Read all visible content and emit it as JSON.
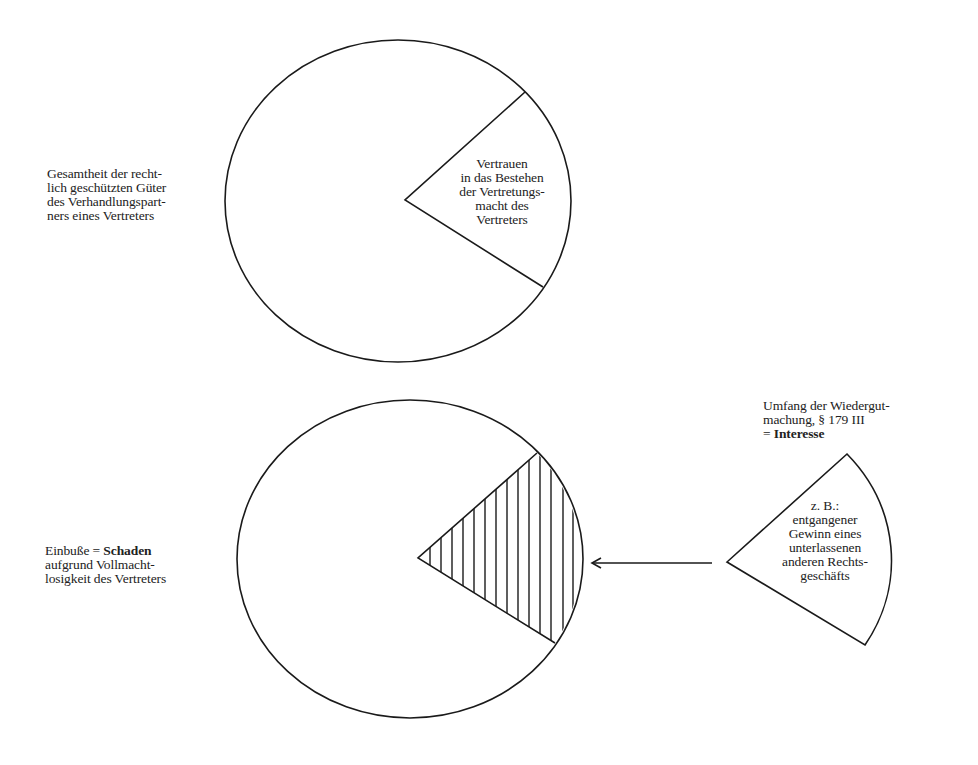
{
  "diagram": {
    "top_circle": {
      "label_left": [
        "Gesamtheit der recht-",
        "lich geschützten Güter",
        "des Verhandlungspart-",
        "ners eines Vertreters"
      ],
      "slice_label": [
        "Vertrauen",
        "in das Bestehen",
        "der Vertretungs-",
        "macht des",
        "Vertreters"
      ]
    },
    "bottom_circle": {
      "label_left": {
        "line1_prefix": "Einbuße = ",
        "line1_bold": "Schaden",
        "line2": "aufgrund Vollmacht-",
        "line3": "losigkeit des Vertreters"
      },
      "hatched_slice": "Schaden (hatched)"
    },
    "detached_sector": {
      "heading": {
        "line1": "Umfang der Wiedergut-",
        "line2": "machung, § 179 III",
        "line3_prefix": "= ",
        "line3_bold": "Interesse"
      },
      "label": [
        "z. B.:",
        "entgangener",
        "Gewinn eines",
        "unterlassenen",
        "anderen Rechts-",
        "geschäfts"
      ]
    },
    "arrow": {
      "direction": "left",
      "from": "detached_sector",
      "to": "hatched_slice"
    },
    "colors": {
      "stroke": "#1a1a1a",
      "text": "#222222",
      "background": "#ffffff"
    }
  }
}
